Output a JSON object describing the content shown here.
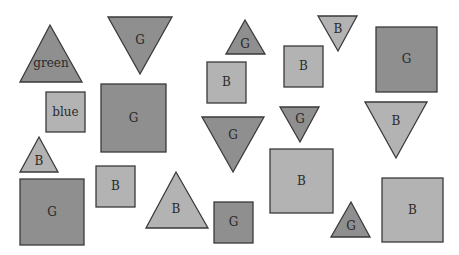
{
  "colors": {
    "green": "#8f8f8f",
    "blue": "#b3b3b3",
    "stroke": "#3a3a3a",
    "text": "#2a2a2a"
  },
  "shapes": [
    {
      "id": "s1",
      "type": "triangle-up",
      "color": "green",
      "label": "green",
      "points": "20,82 50,25 82,82",
      "lx": 51,
      "ly": 63
    },
    {
      "id": "s2",
      "type": "triangle-down",
      "color": "green",
      "label": "G",
      "points": "108,17 172,17 140,74",
      "lx": 140,
      "ly": 40
    },
    {
      "id": "s3",
      "type": "triangle-up",
      "color": "green",
      "label": "G",
      "points": "226,54 245,20 265,54",
      "lx": 245,
      "ly": 44
    },
    {
      "id": "s4",
      "type": "triangle-down",
      "color": "blue",
      "label": "B",
      "points": "318,16 357,16 338,51",
      "lx": 338,
      "ly": 29
    },
    {
      "id": "s5",
      "type": "square",
      "color": "green",
      "label": "G",
      "x": 376,
      "y": 27,
      "w": 61,
      "h": 65
    },
    {
      "id": "s6",
      "type": "square",
      "color": "blue",
      "label": "blue",
      "x": 46,
      "y": 92,
      "w": 39,
      "h": 40
    },
    {
      "id": "s7",
      "type": "square",
      "color": "green",
      "label": "G",
      "x": 101,
      "y": 84,
      "w": 65,
      "h": 68
    },
    {
      "id": "s8",
      "type": "square",
      "color": "blue",
      "label": "B",
      "x": 207,
      "y": 62,
      "w": 39,
      "h": 41
    },
    {
      "id": "s9",
      "type": "square",
      "color": "blue",
      "label": "B",
      "x": 284,
      "y": 46,
      "w": 39,
      "h": 41
    },
    {
      "id": "s10",
      "type": "triangle-down",
      "color": "green",
      "label": "G",
      "points": "202,117 264,117 233,172",
      "lx": 233,
      "ly": 135
    },
    {
      "id": "s11",
      "type": "triangle-down",
      "color": "green",
      "label": "G",
      "points": "280,107 319,107 300,142",
      "lx": 300,
      "ly": 119
    },
    {
      "id": "s12",
      "type": "triangle-down",
      "color": "blue",
      "label": "B",
      "points": "365,102 427,102 396,158",
      "lx": 396,
      "ly": 121
    },
    {
      "id": "s13",
      "type": "triangle-up",
      "color": "blue",
      "label": "B",
      "points": "20,172 39,137 58,172",
      "lx": 39,
      "ly": 161
    },
    {
      "id": "s14",
      "type": "square",
      "color": "green",
      "label": "G",
      "x": 20,
      "y": 179,
      "w": 64,
      "h": 66
    },
    {
      "id": "s15",
      "type": "square",
      "color": "blue",
      "label": "B",
      "x": 96,
      "y": 166,
      "w": 39,
      "h": 41
    },
    {
      "id": "s16",
      "type": "triangle-up",
      "color": "blue",
      "label": "B",
      "points": "146,228 176,172 208,228",
      "lx": 176,
      "ly": 209
    },
    {
      "id": "s17",
      "type": "square",
      "color": "green",
      "label": "G",
      "x": 214,
      "y": 202,
      "w": 39,
      "h": 41
    },
    {
      "id": "s18",
      "type": "square",
      "color": "blue",
      "label": "B",
      "x": 270,
      "y": 149,
      "w": 63,
      "h": 64
    },
    {
      "id": "s19",
      "type": "triangle-up",
      "color": "green",
      "label": "G",
      "points": "331,237 351,202 370,237",
      "lx": 351,
      "ly": 226
    },
    {
      "id": "s20",
      "type": "square",
      "color": "blue",
      "label": "B",
      "x": 382,
      "y": 178,
      "w": 61,
      "h": 64
    }
  ]
}
